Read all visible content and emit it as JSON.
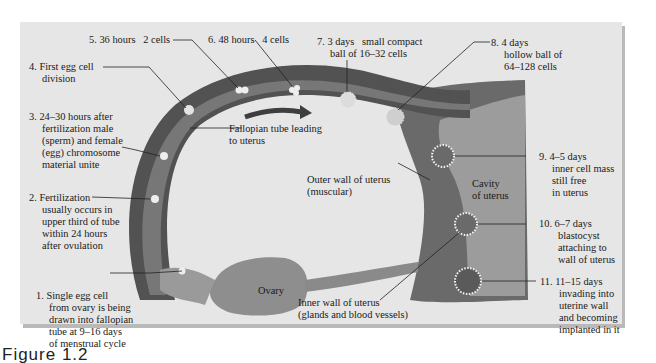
{
  "figure": {
    "caption": "Figure 1.2",
    "colors": {
      "panel": "#e6e6e6",
      "tube_outer": "#545454",
      "tube_inner": "#7a7a7a",
      "uterus_wall": "#6e6e6e",
      "uterus_cavity": "#9a9a9a",
      "ovary": "#8c8c8c",
      "cells": "#e8e8e8"
    }
  },
  "labels": {
    "l1": {
      "head": "1. Single egg cell",
      "lines": [
        "from ovary is being",
        "drawn into fallopian",
        "tube at 9–16 days",
        "of menstrual cycle"
      ]
    },
    "l2": {
      "head": "2. Fertilization",
      "lines": [
        "usually occurs in",
        "upper third of tube",
        "within 24 hours",
        "after ovulation"
      ]
    },
    "l3": {
      "head": "3. 24–30 hours after",
      "lines": [
        "fertilization male",
        "(sperm) and female",
        "(egg) chromosome",
        "material unite"
      ]
    },
    "l4": {
      "head": "4. First egg cell",
      "lines": [
        "division"
      ]
    },
    "l5": {
      "head": "5. 36 hours   2 cells"
    },
    "l6": {
      "head": "6. 48 hours   4 cells"
    },
    "l7": {
      "head": "7. 3 days   small compact",
      "lines": [
        "ball of 16–32 cells"
      ]
    },
    "l8": {
      "head": "8. 4 days",
      "lines": [
        "hollow ball of",
        "64–128 cells"
      ]
    },
    "l9": {
      "head": "9. 4–5 days",
      "lines": [
        "inner cell mass",
        "still free",
        "in uterus"
      ]
    },
    "l10": {
      "head": "10. 6–7 days",
      "lines": [
        "blastocyst",
        "attaching to",
        "wall of uterus"
      ]
    },
    "l11": {
      "head": "11. 11–15 days",
      "lines": [
        "invading into",
        "uterine wall",
        "and becoming",
        "implanted in it"
      ]
    },
    "tube": {
      "lines": [
        "Fallopian tube leading",
        "to uterus"
      ]
    },
    "outer_wall": {
      "lines": [
        "Outer wall of uterus",
        "(muscular)"
      ]
    },
    "inner_wall": {
      "lines": [
        "Inner wall of uterus",
        "(glands and blood vessels)"
      ]
    },
    "cavity": {
      "lines": [
        "Cavity",
        "of uterus"
      ]
    },
    "ovary": {
      "lines": [
        "Ovary"
      ]
    }
  }
}
